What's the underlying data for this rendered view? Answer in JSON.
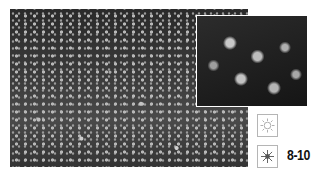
{
  "figure": {
    "main_photo": {
      "subject": "field of small white star-shaped flowers",
      "tone": "grayscale"
    },
    "inset_photo": {
      "subject": "close-up of star-shaped flowers",
      "tone": "grayscale"
    }
  },
  "legend": {
    "sun_icon": "sun-outline-icon",
    "partial_sun_icon": "sun-filled-icon",
    "zones": "8-10"
  },
  "colors": {
    "icon_border": "#b5b5b5",
    "text": "#111111",
    "inset_border": "#ffffff"
  }
}
